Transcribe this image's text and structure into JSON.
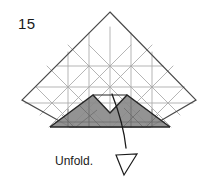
{
  "figure": {
    "step_number": "15",
    "caption": "Unfold.",
    "title": "Origami fold step 15 diagram",
    "colors": {
      "paper_outline": "#4a4a4a",
      "crease_line": "#9a9a9a",
      "crease_line_light": "#b4b4b4",
      "shaded_fill": "#8a8a8a",
      "shaded_outline": "#2b2b2b",
      "arrow": "#1a1a1a",
      "background": "#ffffff",
      "text": "#1a1a1a"
    },
    "shapes": {
      "paper_outline_label": "diamond-kite-paper-outline",
      "paper_vertices": "110,12 196,100 150,127 70,127 22,100",
      "shaded_region_label": "shaded-mountain-flap",
      "shaded_vertices": "50,127 93,95 110,113 127,95 170,127",
      "notch_label": "v-notch-cut",
      "arrow_label": "unfold-arrow",
      "arrow_path": "curved line from notch down to hollow arrowhead",
      "arrowhead_tip": "125,178"
    }
  }
}
